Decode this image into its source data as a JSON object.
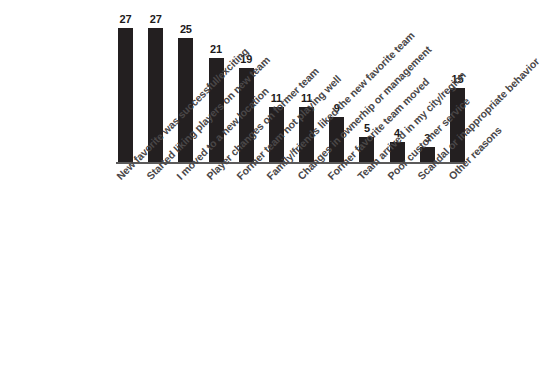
{
  "chart_data": {
    "type": "bar",
    "title": "",
    "subtitle": "",
    "xlabel": "",
    "ylabel": "",
    "ylim": [
      0,
      27
    ],
    "grid": false,
    "legend": false,
    "orientation": "vertical",
    "bar_color": "#231f20",
    "axis_color": "#5b5a5a",
    "label_color": "#4a4748",
    "categories": [
      "New favorite was successful/exciting",
      "Started liking players on new team",
      "I moved to a new location",
      "Player changes on former team",
      "Former team not playing well",
      "Family/friends liked the new favorite team",
      "Changes in ownerhip or management",
      "Former favorite team moved",
      "Team arrived in my city/region",
      "Poor customer service",
      "Scandal or inappropriate behavior",
      "Other reasons"
    ],
    "values": [
      27,
      27,
      25,
      21,
      19,
      11,
      11,
      9,
      5,
      4,
      3,
      15
    ],
    "value_labels": [
      "27",
      "27",
      "25",
      "21",
      "19",
      "11",
      "11",
      "9",
      "5",
      "4",
      "3",
      "15"
    ]
  }
}
